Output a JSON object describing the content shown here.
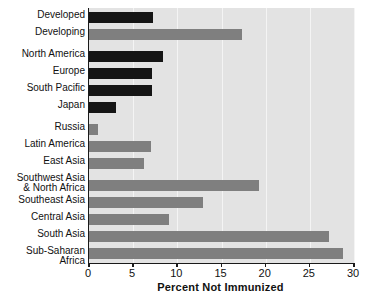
{
  "chart_data": {
    "type": "bar",
    "orientation": "horizontal",
    "title": "",
    "xlabel": "Percent Not Immunized",
    "ylabel": "",
    "xlim": [
      0,
      30
    ],
    "xticks": [
      0,
      5,
      10,
      15,
      20,
      25,
      30
    ],
    "xtick_labels": [
      "0",
      "5",
      "10",
      "15",
      "20",
      "25",
      "30"
    ],
    "grid": true,
    "legend": "none",
    "colors": {
      "developed_series": "#151515",
      "developing_series": "#7f7f7f",
      "plot_background": "#e3e3e3",
      "gridline": "#f4f4f4",
      "axis": "#1a1a1a",
      "text": "#111111"
    },
    "categories": [
      "Developed",
      "Developing",
      "North America",
      "Europe",
      "South Pacific",
      "Japan",
      "Russia",
      "Latin America",
      "East Asia",
      "Southwest Asia\n& North Africa",
      "Southeast Asia",
      "Central Asia",
      "South Asia",
      "Sub-Saharan Africa"
    ],
    "values": [
      7.2,
      17.3,
      8.4,
      7.1,
      7.1,
      3.1,
      1.0,
      7.0,
      6.2,
      19.2,
      12.9,
      9.1,
      27.2,
      28.8
    ],
    "bar_colors": [
      "#151515",
      "#7f7f7f",
      "#151515",
      "#151515",
      "#151515",
      "#151515",
      "#7f7f7f",
      "#7f7f7f",
      "#7f7f7f",
      "#7f7f7f",
      "#7f7f7f",
      "#7f7f7f",
      "#7f7f7f",
      "#7f7f7f"
    ],
    "bar_tops": [
      12,
      29,
      51,
      68,
      85,
      102,
      124,
      141,
      158,
      180,
      197,
      214,
      231,
      248
    ],
    "label_tops": [
      10,
      27,
      49,
      66,
      83,
      100,
      122,
      139,
      156,
      173,
      195,
      212,
      229,
      246
    ],
    "group_gaps_after": [
      "Developing",
      "Japan",
      "Russia"
    ]
  }
}
